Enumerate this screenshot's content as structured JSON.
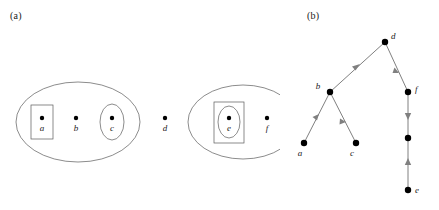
{
  "figure": {
    "panels": [
      {
        "label": "(a)",
        "name": "panel-a",
        "caption_position": "top-left",
        "description": "nested set containment diagram",
        "groups": [
          {
            "name": "left-group",
            "outer_shape": "ellipse",
            "members": [
              {
                "id": "a",
                "label": "a",
                "enclosure": "rectangle"
              },
              {
                "id": "b",
                "label": "b",
                "enclosure": "none"
              },
              {
                "id": "c",
                "label": "c",
                "enclosure": "ellipse"
              }
            ]
          },
          {
            "name": "right-group",
            "outer_shape": "ellipse",
            "members": [
              {
                "id": "e",
                "label": "e",
                "enclosure": "rectangle-and-ellipse"
              },
              {
                "id": "f",
                "label": "f",
                "enclosure": "none"
              }
            ]
          }
        ],
        "free_points": [
          {
            "id": "d",
            "label": "d",
            "enclosure": "none"
          }
        ]
      },
      {
        "label": "(b)",
        "name": "panel-b",
        "caption_position": "top-left",
        "description": "directed graph of the containment relation",
        "nodes": [
          {
            "id": "d",
            "label": "d",
            "label_position": "right"
          },
          {
            "id": "b",
            "label": "b",
            "label_position": "left"
          },
          {
            "id": "f",
            "label": "f",
            "label_position": "right"
          },
          {
            "id": "a",
            "label": "a",
            "label_position": "below-left"
          },
          {
            "id": "c",
            "label": "c",
            "label_position": "below-left"
          },
          {
            "id": "m",
            "label": "",
            "label_position": "none"
          },
          {
            "id": "e",
            "label": "e",
            "label_position": "right"
          }
        ],
        "edges": [
          {
            "from": "b",
            "to": "d",
            "direction": "up-right"
          },
          {
            "from": "d",
            "to": "f",
            "direction": "down-right"
          },
          {
            "from": "a",
            "to": "b",
            "direction": "up-right"
          },
          {
            "from": "b",
            "to": "c",
            "direction": "down-right"
          },
          {
            "from": "f",
            "to": "m",
            "direction": "down"
          },
          {
            "from": "e",
            "to": "m",
            "direction": "up"
          }
        ]
      }
    ]
  },
  "colors": {
    "background": "#ffffff",
    "node": "#000000",
    "outline": "#5a5a5a",
    "edge": "#808080",
    "text": "#1a1a1a"
  },
  "labels": {
    "a": "a",
    "b": "b",
    "c": "c",
    "d": "d",
    "e": "e",
    "f": "f"
  }
}
